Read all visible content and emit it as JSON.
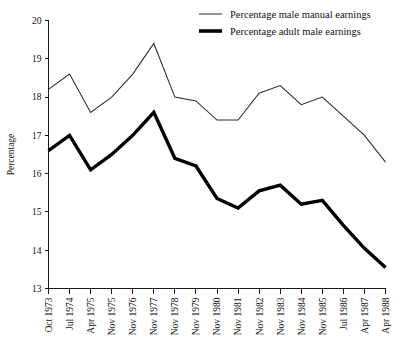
{
  "chart_data": {
    "type": "line",
    "title": "",
    "xlabel": "",
    "ylabel": "Percentage",
    "ylim": [
      13,
      20
    ],
    "yticks": [
      13,
      14,
      15,
      16,
      17,
      18,
      19,
      20
    ],
    "ytick_labels": [
      "13",
      "14",
      "15",
      "16",
      "17",
      "18",
      "19",
      "20"
    ],
    "grid": false,
    "legend_position": "top-right",
    "categories": [
      "Oct 1973",
      "Jul 1974",
      "Apr 1975",
      "Nov 1975",
      "Nov 1976",
      "Nov 1977",
      "Nov 1978",
      "Nov 1979",
      "Nov 1980",
      "Nov 1981",
      "Nov 1982",
      "Nov 1983",
      "Nov 1984",
      "Nov 1985",
      "Jul 1986",
      "Apr 1987",
      "Apr 1988"
    ],
    "series": [
      {
        "name": "Percentage male manual earnings",
        "style": "thin",
        "color": "#2a2a2a",
        "values": [
          18.2,
          18.6,
          17.6,
          18.0,
          18.6,
          19.4,
          18.0,
          17.9,
          17.4,
          17.4,
          18.1,
          18.3,
          17.8,
          18.0,
          17.5,
          17.0,
          16.3
        ]
      },
      {
        "name": "Percentage adult male earnings",
        "style": "thick",
        "color": "#000000",
        "values": [
          16.6,
          17.0,
          16.1,
          16.5,
          17.0,
          17.6,
          16.4,
          16.2,
          15.35,
          15.1,
          15.55,
          15.7,
          15.2,
          15.3,
          14.65,
          14.05,
          13.55
        ]
      }
    ]
  },
  "legend": {
    "entries": [
      {
        "label": "Percentage male manual earnings",
        "style": "thin"
      },
      {
        "label": "Percentage adult male earnings",
        "style": "thick"
      }
    ]
  }
}
